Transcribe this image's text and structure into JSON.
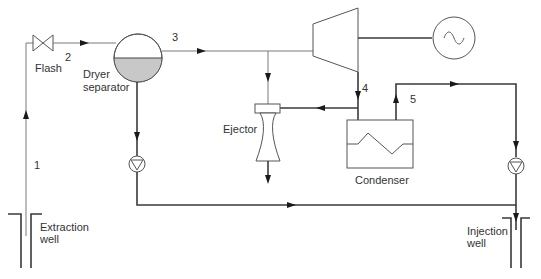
{
  "diagram": {
    "colors": {
      "liquid_fill": "#c8c8c8",
      "line": "#555555",
      "arrow": "#1a1a1a"
    },
    "labels": {
      "flash": "Flash",
      "dryer_line1": "Dryer",
      "dryer_line2": "separator",
      "ejector": "Ejector",
      "condenser": "Condenser",
      "extraction_line1": "Extraction",
      "extraction_line2": "well",
      "injection_line1": "Injection",
      "injection_line2": "well"
    },
    "states": {
      "s1": "1",
      "s2": "2",
      "s3": "3",
      "s4": "4",
      "s5": "5"
    },
    "components": [
      {
        "id": "extraction-well",
        "type": "well"
      },
      {
        "id": "flash-valve",
        "type": "throttle-valve"
      },
      {
        "id": "dryer-separator",
        "type": "separator"
      },
      {
        "id": "turbine",
        "type": "turbine"
      },
      {
        "id": "generator",
        "type": "generator"
      },
      {
        "id": "ejector",
        "type": "ejector"
      },
      {
        "id": "condenser",
        "type": "condenser"
      },
      {
        "id": "brine-pump",
        "type": "pump"
      },
      {
        "id": "condensate-pump",
        "type": "pump"
      },
      {
        "id": "injection-well",
        "type": "well"
      }
    ]
  }
}
